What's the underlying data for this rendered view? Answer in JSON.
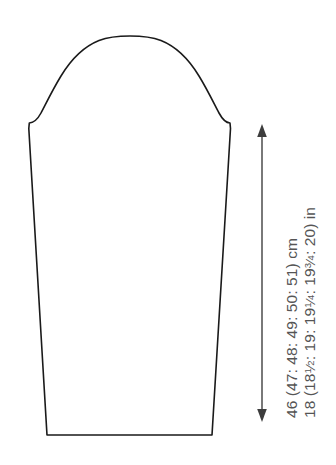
{
  "diagram": {
    "piece_name": "sleeve",
    "background_color": "#ffffff",
    "outline_color": "#1a1a1a",
    "dimension_color": "#4d4d4d",
    "text_color": "#555555"
  },
  "measurements": {
    "vertical": {
      "orientation": "vertical",
      "arrow_style": "double-headed",
      "cm_text": "46 (47: 48: 49: 50: 51) cm",
      "in_text_prefix": "18 (18",
      "in_text_mid": ": 19: 19",
      "in_text_mid2": ": 19",
      "in_text_suffix": ": 20) in",
      "in_text_plain": "18 (18½: 19: 19¼: 19¾: 20) in",
      "cm_base_value": 46,
      "cm_sizes": [
        46,
        47,
        48,
        49,
        50,
        51
      ],
      "cm_unit": "cm",
      "in_sizes": [
        "18",
        "18½",
        "19",
        "19¼",
        "19¾",
        "20"
      ],
      "in_unit": "in",
      "fractions": {
        "half": {
          "num": "1",
          "den": "2"
        },
        "quarter": {
          "num": "1",
          "den": "4"
        },
        "three_quarter": {
          "num": "3",
          "den": "4"
        }
      }
    }
  },
  "geometry": {
    "outline_path": "M 47 435 L 212 435 L 230.5 128.5 L 230.0 123.0 C 226.5 122.8 222.5 119.5 219.0 113.0 C 214.0 103.5 207.0 89.0 199.0 76.0 C 189.0 59.5 176.0 46.5 161.0 40.5 C 150.0 36.2 138.0 36.0 130.0 36.0 C 122.0 36.0 110.0 36.2 99.0 40.5 C 84.0 46.5 71.0 59.5 61.0 76.0 C 53.0 89.0 46.0 103.5 41.0 113.0 C 37.5 119.5 33.0 122.8 29.3 123.0 L 28.8 128.5 Z",
    "arrow": {
      "x": 262,
      "y_top": 124,
      "y_bottom": 422
    },
    "canvas": {
      "width": 336,
      "height": 465
    }
  }
}
